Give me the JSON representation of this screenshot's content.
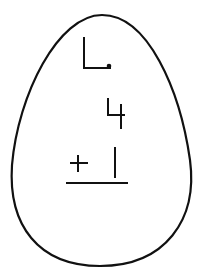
{
  "worksheet": {
    "problem_label": "L.",
    "addend_top": "4",
    "operator": "+",
    "addend_bottom": "1",
    "answer": ""
  },
  "colors": {
    "ink": "#111111",
    "background": "#ffffff"
  }
}
